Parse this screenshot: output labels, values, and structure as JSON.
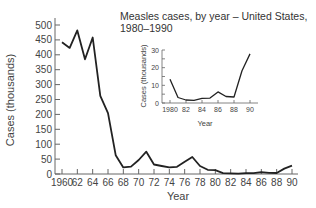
{
  "chart_data": [
    {
      "type": "line",
      "title": "",
      "xlabel": "Year",
      "ylabel": "Cases (thousands)",
      "xlim": [
        1960,
        1990
      ],
      "ylim": [
        0,
        500
      ],
      "yticks": [
        0,
        50,
        100,
        150,
        200,
        250,
        300,
        350,
        400,
        450,
        500
      ],
      "xtick_labels": [
        "1960",
        "62",
        "64",
        "66",
        "68",
        "70",
        "72",
        "74",
        "76",
        "78",
        "80",
        "82",
        "84",
        "86",
        "88",
        "90"
      ],
      "grid": false,
      "x": [
        1960,
        1961,
        1962,
        1963,
        1964,
        1965,
        1966,
        1967,
        1968,
        1969,
        1970,
        1971,
        1972,
        1973,
        1974,
        1975,
        1976,
        1977,
        1978,
        1979,
        1980,
        1981,
        1982,
        1983,
        1984,
        1985,
        1986,
        1987,
        1988,
        1989,
        1990
      ],
      "values": [
        442,
        423,
        482,
        385,
        458,
        262,
        204,
        63,
        22,
        25,
        47,
        75,
        32,
        27,
        22,
        24,
        41,
        57,
        27,
        14,
        13,
        3,
        2,
        1.5,
        2.6,
        2.8,
        6.3,
        3.7,
        3.4,
        18,
        28
      ]
    },
    {
      "type": "line",
      "title": "Measles cases, by year – United States, 1980–1990",
      "xlabel": "Year",
      "ylabel": "Cases (thousands)",
      "xlim": [
        1980,
        1990
      ],
      "ylim": [
        0,
        30
      ],
      "yticks": [
        0,
        10,
        20,
        30
      ],
      "xtick_labels": [
        "1980",
        "82",
        "84",
        "86",
        "88",
        "90"
      ],
      "grid": false,
      "x": [
        1980,
        1981,
        1982,
        1983,
        1984,
        1985,
        1986,
        1987,
        1988,
        1989,
        1990
      ],
      "values": [
        13.5,
        3.1,
        1.7,
        1.5,
        2.6,
        2.8,
        6.3,
        3.7,
        3.4,
        18.2,
        27.8
      ]
    }
  ],
  "labels": {
    "main_ylabel": "Cases (thousands)",
    "main_xlabel": "Year",
    "inset_title_line1": "Measles cases, by year – United States,",
    "inset_title_line2": "1980–1990",
    "inset_ylabel": "Cases (thousands)",
    "inset_xlabel": "Year"
  },
  "colors": {
    "line": "#222222",
    "axis": "#666666",
    "text": "#444444"
  }
}
